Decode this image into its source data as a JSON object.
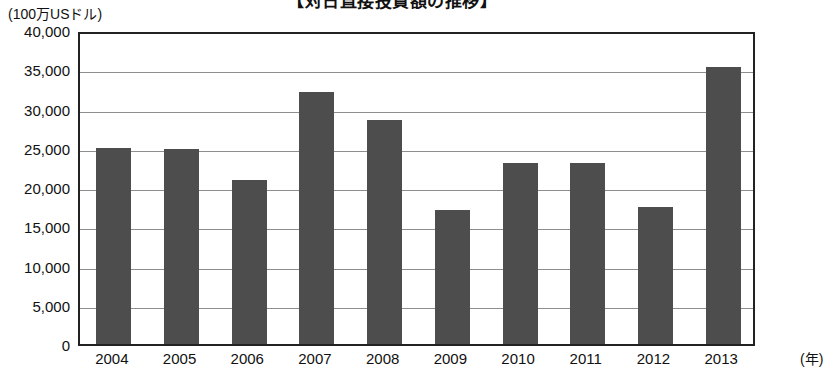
{
  "chart_data": {
    "type": "bar",
    "title": "【対日直接投資額の推移】",
    "unit_label": "(100万USドル)",
    "xlabel": "(年)",
    "ylabel": "",
    "categories": [
      "2004",
      "2005",
      "2006",
      "2007",
      "2008",
      "2009",
      "2010",
      "2011",
      "2012",
      "2013"
    ],
    "values": [
      25000,
      24800,
      20900,
      32100,
      28500,
      17100,
      23000,
      23000,
      17500,
      35300
    ],
    "series": [
      {
        "name": "対日直接投資額",
        "values": [
          25000,
          24800,
          20900,
          32100,
          28500,
          17100,
          23000,
          23000,
          17500,
          35300
        ]
      }
    ],
    "ylim": [
      0,
      40000
    ],
    "ytick_values": [
      0,
      5000,
      10000,
      15000,
      20000,
      25000,
      30000,
      35000,
      40000
    ],
    "ytick_labels": [
      "0",
      "5,000",
      "10,000",
      "15,000",
      "20,000",
      "25,000",
      "30,000",
      "35,000",
      "40,000"
    ],
    "grid": true,
    "legend": false,
    "legend_position": "none",
    "bar_color": "#4d4d4d",
    "axis_color": "#222222",
    "grid_color": "#8e8e8e",
    "background_color": "#ffffff"
  }
}
